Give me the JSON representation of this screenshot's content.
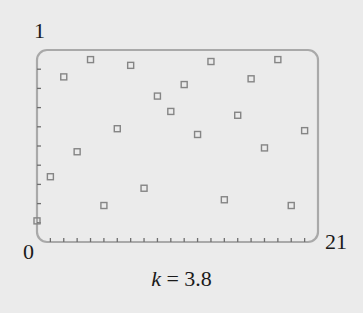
{
  "chart_data": {
    "type": "scatter",
    "title": "",
    "xlabel": "",
    "ylabel": "",
    "xlim": [
      0,
      21
    ],
    "ylim": [
      0,
      1
    ],
    "x_tick_labels": {
      "left": "0",
      "right": "21"
    },
    "y_tick_labels": {
      "top": "1"
    },
    "x_minor_ticks": [
      1,
      2,
      3,
      4,
      5,
      6,
      7,
      8,
      9,
      10,
      11,
      12,
      13,
      14,
      15,
      16,
      17,
      18,
      19,
      20
    ],
    "y_minor_ticks": [
      0.1,
      0.2,
      0.3,
      0.4,
      0.5,
      0.6,
      0.7,
      0.8,
      0.9
    ],
    "grid": false,
    "marker": "hollow-square",
    "annotation": "k = 3.8",
    "parameter": {
      "name": "k",
      "value": 3.8
    },
    "x": [
      0,
      1,
      2,
      3,
      4,
      5,
      6,
      7,
      8,
      9,
      10,
      11,
      12,
      13,
      14,
      15,
      16,
      17,
      18,
      19,
      20
    ],
    "values": [
      0.11,
      0.34,
      0.86,
      0.47,
      0.95,
      0.19,
      0.59,
      0.92,
      0.28,
      0.76,
      0.68,
      0.82,
      0.56,
      0.94,
      0.22,
      0.66,
      0.85,
      0.49,
      0.95,
      0.19,
      0.58
    ]
  },
  "labels": {
    "y_top": "1",
    "origin": "0",
    "x_right": "21",
    "param_name": "k",
    "param_eq": " = 3.8"
  },
  "colors": {
    "background": "#ebebeb",
    "frame": "#a9a9a9",
    "marker": "#858585",
    "tick": "#6e6e6e"
  }
}
